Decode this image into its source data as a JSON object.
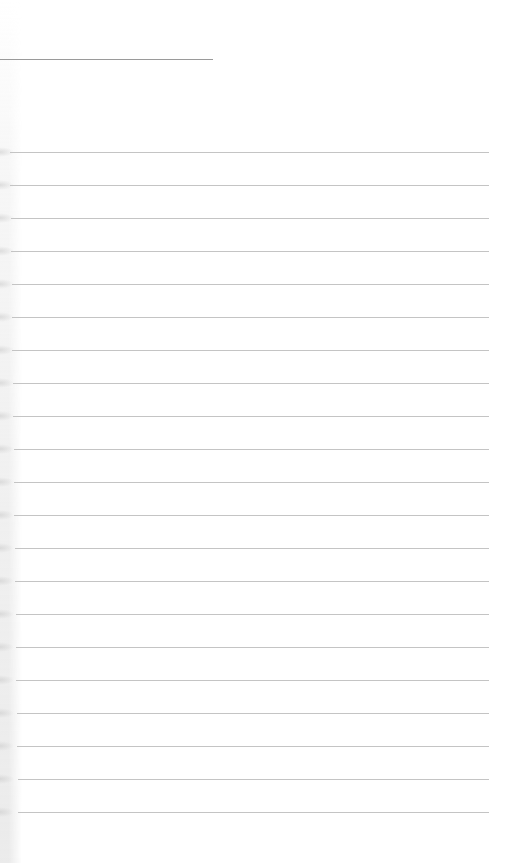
{
  "page": {
    "type": "blank lined notebook page",
    "background_color": "#ffffff",
    "header_line": {
      "color": "#9a9a9a",
      "y": 59,
      "x_start": 0,
      "x_end": 213
    },
    "ruled_lines": {
      "count": 21,
      "first_y": 152,
      "spacing": 33,
      "x_start": 10,
      "x_end": 489,
      "color": "#c4c4c4"
    },
    "text": []
  }
}
